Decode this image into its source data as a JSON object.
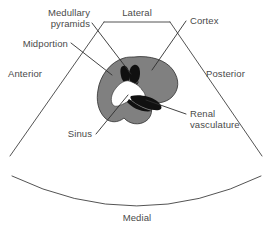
{
  "figure": {
    "kind": "ultrasound-scan-plane-schematic",
    "background_color": "#ffffff",
    "line_color": "#3f3f3f",
    "text_color": "#4a4a4a"
  },
  "sector": {
    "name": "ultrasound sector field of view",
    "top_label": "Lateral",
    "bottom_label": "Medial",
    "left_label": "Anterior",
    "right_label": "Posterior"
  },
  "organ": {
    "name": "kidney",
    "cortex_color": "#808080",
    "pyramid_color": "#101010",
    "sinus_color": "#ffffff",
    "vasculature_color": "#101010"
  },
  "annotations": [
    {
      "id": "medullary-pyramids",
      "line1": "Medullary",
      "line2": "pyramids",
      "target": "black wedge-shaped pyramids at top of kidney"
    },
    {
      "id": "midportion",
      "line1": "Midportion",
      "line2": "",
      "target": "mid gray cortex of kidney"
    },
    {
      "id": "cortex",
      "line1": "Cortex",
      "line2": "",
      "target": "outer gray rim of kidney"
    },
    {
      "id": "sinus",
      "line1": "Sinus",
      "line2": "",
      "target": "central white renal sinus"
    },
    {
      "id": "renal-vasculature",
      "line1": "Renal",
      "line2": "vasculature",
      "target": "black hilar vessels"
    }
  ]
}
